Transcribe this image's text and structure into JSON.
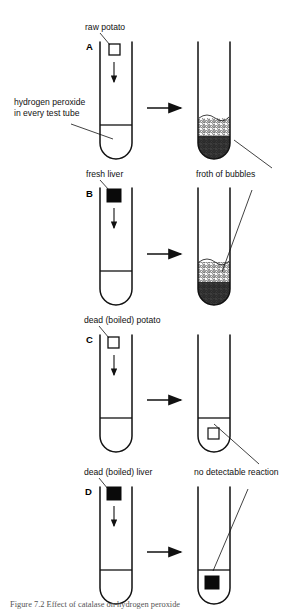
{
  "figure": {
    "caption": "Figure 7.2 Effect of catalase on hydrogen peroxide",
    "shared_label": {
      "line1": "hydrogen peroxide",
      "line2": "in every test tube"
    },
    "result_labels": {
      "froth": "froth of bubbles",
      "no_reaction": "no detectable reaction"
    }
  },
  "panels": [
    {
      "letter": "A",
      "sample_label": "raw potato",
      "sample_fill": "white",
      "result": "froth of bubbles",
      "reaction": true
    },
    {
      "letter": "B",
      "sample_label": "fresh liver",
      "sample_fill": "black",
      "result": "froth of bubbles",
      "reaction": true
    },
    {
      "letter": "C",
      "sample_label": "dead (boiled) potato",
      "sample_fill": "white",
      "result": "no detectable reaction",
      "reaction": false
    },
    {
      "letter": "D",
      "sample_label": "dead (boiled) liver",
      "sample_fill": "black",
      "result": "no detectable reaction",
      "reaction": false
    }
  ],
  "colors": {
    "ink": "#111111",
    "fill_black": "#0a0a0a",
    "fill_white": "#ffffff",
    "caption": "#555555"
  }
}
